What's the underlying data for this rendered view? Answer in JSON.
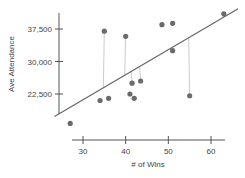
{
  "chart_data": {
    "type": "scatter",
    "title": "",
    "xlabel": "# of Wins",
    "ylabel": "Ave Attendance",
    "xlim": [
      25,
      64
    ],
    "ylim": [
      12000,
      43000
    ],
    "xticks": [
      30,
      40,
      50,
      60
    ],
    "xtick_labels": [
      "30",
      "40",
      "50",
      "60"
    ],
    "yticks": [
      22500,
      30000,
      37500
    ],
    "ytick_labels": [
      "22,500",
      "30,000",
      "37,500"
    ],
    "grid": false,
    "legend": null,
    "colors": {
      "points": "#6b6b6b",
      "line": "#666666",
      "residuals": "#cccccc",
      "axis": "#555555"
    },
    "points": [
      {
        "x": 27,
        "y": 15700
      },
      {
        "x": 34,
        "y": 21000
      },
      {
        "x": 36,
        "y": 21500
      },
      {
        "x": 35,
        "y": 37000
      },
      {
        "x": 40,
        "y": 35800
      },
      {
        "x": 41,
        "y": 22500
      },
      {
        "x": 42,
        "y": 21500
      },
      {
        "x": 41.5,
        "y": 25000
      },
      {
        "x": 43.5,
        "y": 25500
      },
      {
        "x": 48.5,
        "y": 38500
      },
      {
        "x": 51,
        "y": 38800
      },
      {
        "x": 51,
        "y": 32500
      },
      {
        "x": 55,
        "y": 22100
      },
      {
        "x": 63,
        "y": 41000
      }
    ],
    "regression_line": {
      "x": [
        28,
        64
      ],
      "y": [
        20000,
        40800
      ]
    },
    "residual_lines_shown_for": [
      {
        "x": 35,
        "y": 37000
      },
      {
        "x": 40,
        "y": 35800
      },
      {
        "x": 41.5,
        "y": 25000
      },
      {
        "x": 43.5,
        "y": 25500
      },
      {
        "x": 55,
        "y": 22100
      },
      {
        "x": 63,
        "y": 41000
      }
    ]
  }
}
